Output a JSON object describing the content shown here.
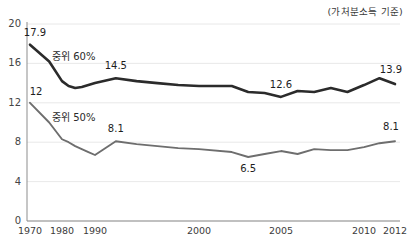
{
  "header": {
    "unit_note": "(가처분소득 기준)"
  },
  "chart_data": {
    "type": "line",
    "title": "",
    "subtitle": "",
    "xlabel": "",
    "ylabel": "",
    "unit_note": "(가처분소득 기준)",
    "ylim": [
      0,
      20
    ],
    "yticks": [
      0,
      4,
      8,
      12,
      16,
      20
    ],
    "ytick_labels": [
      "0",
      "4",
      "8",
      "12",
      "16",
      "20"
    ],
    "grid": true,
    "grid_axis": "y",
    "legend_position": "inline",
    "xtick_labels": [
      "1970",
      "1980",
      "1990",
      "2000",
      "2005",
      "2010",
      "2012"
    ],
    "xticks": [
      1970,
      1980,
      1990,
      2000,
      2005,
      2010,
      2012
    ],
    "x_axis_note": "non-uniform spacing: 1970-1990 compressed, 1990-2012 expanded",
    "series": [
      {
        "name": "중위 60%",
        "color": "#2b2b2b",
        "x": [
          1970,
          1976,
          1980,
          1982,
          1984,
          1986,
          1988,
          1990,
          1992,
          1994,
          1996,
          1998,
          2000,
          2002,
          2003,
          2004,
          2005,
          2006,
          2007,
          2008,
          2009,
          2010,
          2011,
          2012
        ],
        "values": [
          17.9,
          16.2,
          14.2,
          13.7,
          13.5,
          13.6,
          13.8,
          14.0,
          14.5,
          14.2,
          14.0,
          13.8,
          13.7,
          13.7,
          13.1,
          13.0,
          12.6,
          13.2,
          13.1,
          13.5,
          13.1,
          13.8,
          14.5,
          13.9
        ]
      },
      {
        "name": "중위 50%",
        "color": "#6e6e6e",
        "x": [
          1970,
          1976,
          1980,
          1982,
          1984,
          1986,
          1988,
          1990,
          1992,
          1994,
          1996,
          1998,
          2000,
          2002,
          2003,
          2004,
          2005,
          2006,
          2007,
          2008,
          2009,
          2010,
          2011,
          2012
        ],
        "values": [
          12.0,
          10.0,
          8.3,
          8.0,
          7.6,
          7.3,
          7.0,
          6.7,
          8.1,
          7.8,
          7.6,
          7.4,
          7.3,
          7.0,
          6.5,
          6.8,
          7.1,
          6.8,
          7.3,
          7.2,
          7.2,
          7.5,
          7.9,
          8.1
        ]
      }
    ],
    "point_labels": [
      {
        "series": "중위 60%",
        "x": 1970,
        "value": 17.9,
        "text": "17.9",
        "dx": 5,
        "dy": -9
      },
      {
        "series": "중위 60%",
        "x": 1992,
        "value": 14.5,
        "text": "14.5",
        "dx": 0,
        "dy": -9
      },
      {
        "series": "중위 60%",
        "x": 2005,
        "value": 12.6,
        "text": "12.6",
        "dx": 0,
        "dy": -9
      },
      {
        "series": "중위 60%",
        "x": 2012,
        "value": 13.9,
        "text": "13.9",
        "dx": -4,
        "dy": -11
      },
      {
        "series": "중위 50%",
        "x": 1970,
        "value": 12.0,
        "text": "12",
        "dx": 6,
        "dy": -8
      },
      {
        "series": "중위 50%",
        "x": 1992,
        "value": 8.1,
        "text": "8.1",
        "dx": 0,
        "dy": -9
      },
      {
        "series": "중위 50%",
        "x": 2003,
        "value": 6.5,
        "text": "6.5",
        "dx": 0,
        "dy": 15
      },
      {
        "series": "중위 50%",
        "x": 2012,
        "value": 8.1,
        "text": "8.1",
        "dx": -4,
        "dy": -11
      }
    ],
    "inline_labels": [
      {
        "text": "중위 60%",
        "px": 52,
        "py": 60
      },
      {
        "text": "중위 50%",
        "px": 52,
        "py": 121
      }
    ]
  }
}
